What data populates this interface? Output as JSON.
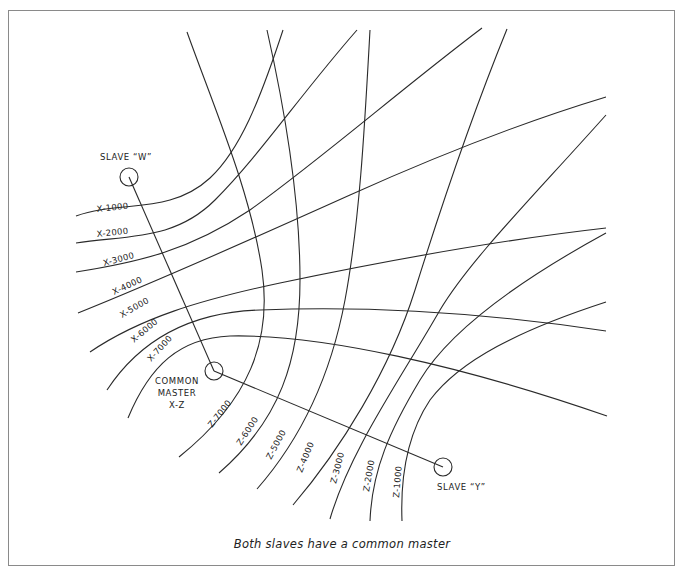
{
  "diagram": {
    "caption": "Both slaves have a common master",
    "stations": {
      "slave_w": {
        "label": "SLAVE “W”"
      },
      "master": {
        "label_line1": "COMMON",
        "label_line2": "MASTER",
        "label_line3": "X-Z"
      },
      "slave_y": {
        "label": "SLAVE “Y”"
      }
    },
    "x_lines": [
      {
        "label": "X-1000"
      },
      {
        "label": "X-2000"
      },
      {
        "label": "X-3000"
      },
      {
        "label": "X-4000"
      },
      {
        "label": "X-5000"
      },
      {
        "label": "X-6000"
      },
      {
        "label": "X-7000"
      }
    ],
    "z_lines": [
      {
        "label": "Z-7000"
      },
      {
        "label": "Z-6000"
      },
      {
        "label": "Z-5000"
      },
      {
        "label": "Z-4000"
      },
      {
        "label": "Z-3000"
      },
      {
        "label": "Z-2000"
      },
      {
        "label": "Z-1000"
      }
    ],
    "colors": {
      "line": "#2a2a2a",
      "frame": "#8a8a8a"
    }
  }
}
